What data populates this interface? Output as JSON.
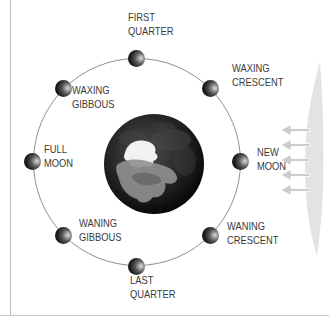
{
  "figure": {
    "kind": "moon-phase-diagram",
    "center_body": "Earth",
    "moon_count": 8
  },
  "phases": [
    {
      "name": "first-quarter",
      "lines": [
        "FIRST",
        "QUARTER"
      ],
      "position": "top"
    },
    {
      "name": "waxing-crescent",
      "lines": [
        "WAXING",
        "CRESCENT"
      ],
      "position": "upper-right"
    },
    {
      "name": "new-moon",
      "lines": [
        "NEW",
        "MOON"
      ],
      "position": "right"
    },
    {
      "name": "waning-crescent",
      "lines": [
        "WANING",
        "CRESCENT"
      ],
      "position": "lower-right"
    },
    {
      "name": "last-quarter",
      "lines": [
        "LAST",
        "QUARTER"
      ],
      "position": "bottom"
    },
    {
      "name": "waning-gibbous",
      "lines": [
        "WANING",
        "GIBBOUS"
      ],
      "position": "lower-left"
    },
    {
      "name": "full-moon",
      "lines": [
        "FULL",
        "MOON"
      ],
      "position": "left"
    },
    {
      "name": "waxing-gibbous",
      "lines": [
        "WAXING",
        "GIBBOUS"
      ],
      "position": "upper-left"
    }
  ],
  "sun": {
    "icon": "sun-edge-with-rays",
    "ray_count": 5,
    "light_direction": "from-right"
  },
  "colors": {
    "background": "#ffffff",
    "label_text": "#3a3a3a",
    "orbit_line": "#8f8f8f",
    "page_rule": "#bcbcbc",
    "moon_dark": "#161616",
    "moon_lit": "#dedede",
    "earth_ice": "#f2f2f2",
    "earth_land": "#909090",
    "sun_glow": "#e3e3e3",
    "sun_arrow": "#cbcdcc"
  }
}
